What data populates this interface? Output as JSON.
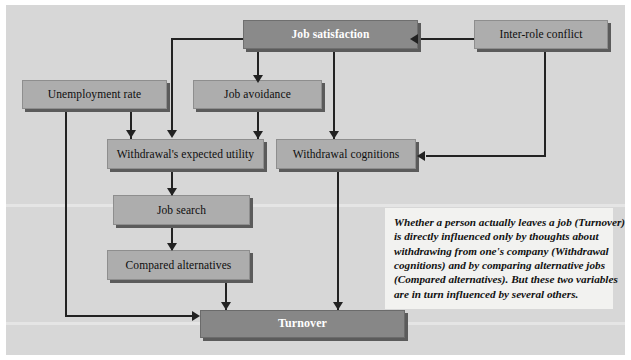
{
  "figure": {
    "background_color": "#d7d7d7",
    "connector_color": "#222222"
  },
  "nodes": [
    {
      "id": "job-satisfaction",
      "label": "Job satisfaction",
      "style": "dark"
    },
    {
      "id": "inter-role-conflict",
      "label": "Inter-role conflict",
      "style": "light"
    },
    {
      "id": "unemployment-rate",
      "label": "Unemployment rate",
      "style": "light"
    },
    {
      "id": "job-avoidance",
      "label": "Job avoidance",
      "style": "light"
    },
    {
      "id": "withdrawal-utility",
      "label": "Withdrawal's expected utility",
      "style": "light"
    },
    {
      "id": "withdrawal-cognitions",
      "label": "Withdrawal cognitions",
      "style": "light"
    },
    {
      "id": "job-search",
      "label": "Job search",
      "style": "light"
    },
    {
      "id": "compared-alternatives",
      "label": "Compared alternatives",
      "style": "light"
    },
    {
      "id": "turnover",
      "label": "Turnover",
      "style": "darkest"
    }
  ],
  "caption": {
    "line1": "Whether a person actually leaves a job (Turnover)",
    "line2": "is directly influenced only by thoughts about",
    "line3": "withdrawing from one's company (Withdrawal",
    "line4": "cognitions) and by comparing alternative jobs",
    "line5": "(Compared alternatives). But these two variables",
    "line6": "are in turn influenced by several others."
  }
}
